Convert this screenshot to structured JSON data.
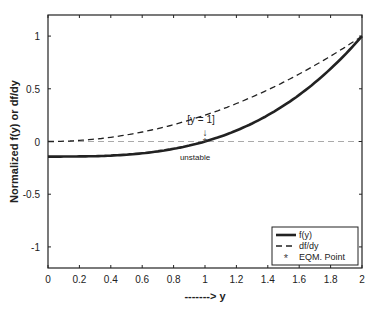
{
  "chart_data": {
    "type": "line",
    "title": "",
    "xlabel": "-------> y",
    "ylabel": "Normalized  f(y) or df/dy",
    "xlim": [
      0,
      2
    ],
    "ylim": [
      -1.2,
      1.2
    ],
    "xticks": [
      "0",
      "0.2",
      "0.4",
      "0.6",
      "0.8",
      "1",
      "1.2",
      "1.4",
      "1.6",
      "1.8",
      "2"
    ],
    "yticks": [
      "-1",
      "-0.5",
      "0",
      "0.5",
      "1"
    ],
    "grid": false,
    "legend_position": "lower right",
    "series": [
      {
        "name": "f(y)",
        "style": "solid-thick",
        "x": [
          0,
          0.2,
          0.4,
          0.6,
          0.8,
          1.0,
          1.2,
          1.4,
          1.6,
          1.8,
          2.0
        ],
        "y": [
          -0.14,
          -0.14,
          -0.13,
          -0.11,
          -0.07,
          0,
          0.1,
          0.25,
          0.44,
          0.69,
          1.0
        ]
      },
      {
        "name": "df/dy",
        "style": "dashed",
        "x": [
          0,
          0.2,
          0.4,
          0.6,
          0.8,
          1.0,
          1.2,
          1.4,
          1.6,
          1.8,
          2.0
        ],
        "y": [
          0,
          0.01,
          0.04,
          0.09,
          0.16,
          0.25,
          0.36,
          0.49,
          0.64,
          0.81,
          1.0
        ]
      },
      {
        "name": "EQM. Point",
        "style": "asterisk",
        "x": [
          1
        ],
        "y": [
          0
        ]
      }
    ],
    "annotations": [
      {
        "text": "[y = 1]",
        "x": 1,
        "y": 0.2
      },
      {
        "text": "unstable",
        "x": 1,
        "y": -0.12
      }
    ],
    "reference_line": {
      "y": 0,
      "style": "dashed-gray"
    }
  }
}
